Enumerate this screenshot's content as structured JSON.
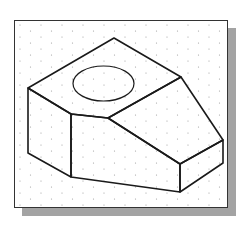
{
  "figure": {
    "type": "isometric-drawing",
    "colors": {
      "background": "#ffffff",
      "frame_border": "#333333",
      "shadow": "#a3a3a3",
      "lines": "#1a1a1a",
      "grid_dots": "#9a9a9a"
    },
    "grid": {
      "style": "isometric-dots",
      "spacing_x": 21,
      "spacing_y": 6
    },
    "vertices": {
      "top_apex": [
        114,
        38
      ],
      "left_top": [
        28,
        88
      ],
      "right_top": [
        181,
        77
      ],
      "notch_corner": [
        71,
        114
      ],
      "inner_notch": [
        108,
        118
      ],
      "right_far_top": [
        223,
        140
      ],
      "front_right_top": [
        180,
        164
      ],
      "left_bottom": [
        28,
        153
      ],
      "front_left_bottom": [
        71,
        177
      ],
      "front_right_bottom": [
        180,
        192
      ],
      "right_far_bottom": [
        223,
        163
      ]
    },
    "ellipse": {
      "cx": 103.5,
      "cy": 83.5,
      "rx": 30.5,
      "ry": 17.5
    }
  }
}
